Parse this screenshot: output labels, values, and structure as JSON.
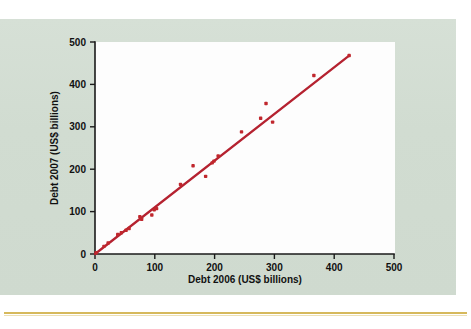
{
  "figure": {
    "panel_bg": "#d3ded3",
    "plot_bg": "#fdfdfd",
    "rule_color": "#d6b95c",
    "point_color": "#c0272d",
    "line_color": "#b52230"
  },
  "chart_data": {
    "type": "scatter",
    "title": "",
    "subtitle": "",
    "xlabel": "Debt 2006 (US$ billions)",
    "ylabel": "Debt 2007 (US$ billions)",
    "xlim": [
      0,
      500
    ],
    "ylim": [
      0,
      500
    ],
    "xticks": [
      0,
      100,
      200,
      300,
      400,
      500
    ],
    "yticks": [
      0,
      100,
      200,
      300,
      400,
      500
    ],
    "xticklabels": [
      "0",
      "100",
      "200",
      "300",
      "400",
      "500"
    ],
    "yticklabels": [
      "0",
      "100",
      "200",
      "300",
      "400",
      "500"
    ],
    "grid": false,
    "legend": null,
    "annotations": [],
    "points": [
      {
        "x": 2,
        "y": 3
      },
      {
        "x": 15,
        "y": 18
      },
      {
        "x": 22,
        "y": 26
      },
      {
        "x": 38,
        "y": 46
      },
      {
        "x": 44,
        "y": 50
      },
      {
        "x": 52,
        "y": 56
      },
      {
        "x": 57,
        "y": 60
      },
      {
        "x": 75,
        "y": 88
      },
      {
        "x": 78,
        "y": 82
      },
      {
        "x": 95,
        "y": 92
      },
      {
        "x": 99,
        "y": 104
      },
      {
        "x": 103,
        "y": 107
      },
      {
        "x": 143,
        "y": 164
      },
      {
        "x": 164,
        "y": 208
      },
      {
        "x": 185,
        "y": 183
      },
      {
        "x": 196,
        "y": 215
      },
      {
        "x": 199,
        "y": 219
      },
      {
        "x": 206,
        "y": 231
      },
      {
        "x": 245,
        "y": 288
      },
      {
        "x": 277,
        "y": 320
      },
      {
        "x": 286,
        "y": 355
      },
      {
        "x": 297,
        "y": 311
      },
      {
        "x": 366,
        "y": 421
      },
      {
        "x": 425,
        "y": 468
      }
    ],
    "fit_line": {
      "label": "trend line",
      "x_start": 0,
      "y_start": 0,
      "x_end": 425,
      "y_end": 468,
      "slope": 1.101,
      "intercept": 0
    },
    "series": [
      {
        "name": "Countries",
        "x": [
          2,
          15,
          22,
          38,
          44,
          52,
          57,
          75,
          78,
          95,
          99,
          103,
          143,
          164,
          185,
          196,
          199,
          206,
          245,
          277,
          286,
          297,
          366,
          425
        ],
        "y": [
          3,
          18,
          26,
          46,
          50,
          56,
          60,
          88,
          82,
          92,
          104,
          107,
          164,
          208,
          183,
          215,
          219,
          231,
          288,
          320,
          355,
          311,
          421,
          468
        ]
      }
    ]
  }
}
